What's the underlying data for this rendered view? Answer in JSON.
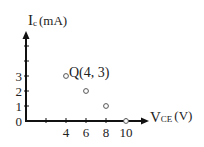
{
  "chart_data": {
    "type": "scatter",
    "title": "",
    "xlabel": "VCE(V)",
    "xlabel_parts": {
      "main": "V",
      "sub": "CE",
      "unit": "(V)"
    },
    "ylabel": "Ic(mA)",
    "ylabel_parts": {
      "main": "I",
      "sub": "c",
      "unit": "(mA)"
    },
    "x_ticks": [
      0,
      2,
      4,
      6,
      8,
      10
    ],
    "x_tick_labels": [
      "4",
      "6",
      "8",
      "10"
    ],
    "y_ticks": [
      0,
      1,
      2,
      3,
      4,
      5
    ],
    "y_tick_labels": [
      "0",
      "1",
      "2",
      "3"
    ],
    "xlim": [
      0,
      12
    ],
    "ylim": [
      0,
      6
    ],
    "grid": false,
    "legend": null,
    "series": [
      {
        "name": "points",
        "marker": "open-circle",
        "x": [
          4,
          6,
          8,
          10
        ],
        "y": [
          3,
          2,
          1,
          0
        ]
      }
    ],
    "annotations": [
      {
        "text": "Q(4, 3)",
        "x": 4,
        "y": 3
      }
    ]
  },
  "colors": {
    "axis": "#111111",
    "marker": "#555555",
    "text": "#222222"
  }
}
